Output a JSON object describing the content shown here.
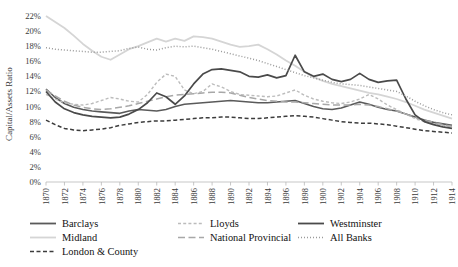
{
  "chart_data": {
    "type": "line",
    "title": "",
    "xlabel": "",
    "ylabel": "Capital/Assets Ratio",
    "ylim": [
      0,
      22
    ],
    "ytick_labels": [
      "0%",
      "2%",
      "4%",
      "6%",
      "8%",
      "10%",
      "12%",
      "14%",
      "16%",
      "18%",
      "20%",
      "22%"
    ],
    "ytick_values": [
      0,
      2,
      4,
      6,
      8,
      10,
      12,
      14,
      16,
      18,
      20,
      22
    ],
    "xlim": [
      1870,
      1914
    ],
    "xtick_labels": [
      "1870",
      "1872",
      "1874",
      "1876",
      "1878",
      "1880",
      "1882",
      "1884",
      "1886",
      "1888",
      "1890",
      "1892",
      "1894",
      "1896",
      "1898",
      "1900",
      "1902",
      "1904",
      "1906",
      "1908",
      "1910",
      "1912",
      "1914"
    ],
    "xtick_values": [
      1870,
      1872,
      1874,
      1876,
      1878,
      1880,
      1882,
      1884,
      1886,
      1888,
      1890,
      1892,
      1894,
      1896,
      1898,
      1900,
      1902,
      1904,
      1906,
      1908,
      1910,
      1912,
      1914
    ],
    "grid": false,
    "legend_position": "bottom",
    "x": [
      1870,
      1871,
      1872,
      1873,
      1874,
      1875,
      1876,
      1877,
      1878,
      1879,
      1880,
      1881,
      1882,
      1883,
      1884,
      1885,
      1886,
      1887,
      1888,
      1889,
      1890,
      1891,
      1892,
      1893,
      1894,
      1895,
      1896,
      1897,
      1898,
      1899,
      1900,
      1901,
      1902,
      1903,
      1904,
      1905,
      1906,
      1907,
      1908,
      1909,
      1910,
      1911,
      1912,
      1913,
      1914
    ],
    "series": [
      {
        "name": "Barclays",
        "color": "#5a5a5a",
        "style": "solid",
        "width": 1.6,
        "values": [
          12.3,
          11.2,
          10.4,
          9.9,
          9.6,
          9.4,
          9.3,
          9.2,
          9.1,
          9.4,
          9.6,
          9.5,
          9.4,
          9.6,
          10.0,
          10.3,
          10.4,
          10.5,
          10.6,
          10.7,
          10.8,
          10.7,
          10.6,
          10.5,
          10.5,
          10.6,
          10.7,
          10.8,
          10.4,
          10.0,
          9.7,
          9.6,
          9.8,
          10.2,
          10.6,
          10.3,
          9.9,
          9.6,
          9.4,
          9.0,
          8.6,
          8.2,
          7.9,
          7.7,
          7.5
        ]
      },
      {
        "name": "Midland",
        "color": "#d5d5d5",
        "style": "solid",
        "width": 1.8,
        "values": [
          22.0,
          21.2,
          20.4,
          19.4,
          18.3,
          17.4,
          16.6,
          16.2,
          16.9,
          17.6,
          18.0,
          18.5,
          19.0,
          18.6,
          19.0,
          18.7,
          19.3,
          19.2,
          19.0,
          18.6,
          18.2,
          17.9,
          18.0,
          18.2,
          17.6,
          16.9,
          16.1,
          15.4,
          14.6,
          13.9,
          13.4,
          13.0,
          12.7,
          12.4,
          12.1,
          11.8,
          11.6,
          11.3,
          11.0,
          10.6,
          10.1,
          9.6,
          9.2,
          8.8,
          8.4
        ]
      },
      {
        "name": "London & County",
        "color": "#3c3c3c",
        "style": "dash-med",
        "width": 1.5,
        "values": [
          8.2,
          7.6,
          7.1,
          6.9,
          6.8,
          6.9,
          7.0,
          7.2,
          7.5,
          7.7,
          7.9,
          8.0,
          8.1,
          8.1,
          8.2,
          8.3,
          8.4,
          8.5,
          8.5,
          8.6,
          8.6,
          8.5,
          8.4,
          8.4,
          8.5,
          8.6,
          8.7,
          8.8,
          8.7,
          8.6,
          8.4,
          8.2,
          8.0,
          7.9,
          7.8,
          7.8,
          7.7,
          7.6,
          7.4,
          7.2,
          7.0,
          6.8,
          6.7,
          6.6,
          6.5
        ]
      },
      {
        "name": "Lloyds",
        "color": "#bcbcbc",
        "style": "dash-short",
        "width": 1.4,
        "values": [
          11.6,
          11.0,
          10.5,
          10.3,
          10.2,
          10.4,
          10.8,
          11.2,
          11.0,
          10.7,
          10.6,
          11.6,
          13.2,
          14.3,
          14.0,
          12.2,
          11.7,
          12.0,
          13.0,
          12.6,
          12.0,
          11.6,
          11.5,
          11.4,
          11.3,
          11.4,
          11.8,
          12.2,
          11.5,
          11.0,
          10.7,
          10.5,
          10.4,
          10.6,
          11.0,
          11.6,
          11.0,
          10.2,
          9.6,
          9.0,
          8.4,
          8.0,
          7.7,
          7.5,
          7.3
        ]
      },
      {
        "name": "National Provincial",
        "color": "#a8a8a8",
        "style": "dash-long",
        "width": 1.5,
        "values": [
          12.2,
          11.4,
          10.7,
          10.2,
          9.9,
          9.7,
          9.6,
          9.7,
          9.9,
          10.1,
          10.4,
          10.7,
          11.0,
          11.3,
          11.5,
          11.6,
          11.7,
          11.8,
          11.9,
          11.9,
          11.8,
          11.5,
          11.2,
          11.0,
          10.8,
          10.7,
          10.6,
          10.6,
          10.5,
          10.4,
          10.3,
          10.2,
          10.2,
          10.2,
          10.3,
          10.2,
          10.0,
          9.7,
          9.4,
          9.0,
          8.6,
          8.2,
          7.9,
          7.6,
          7.4
        ]
      },
      {
        "name": "Westminster",
        "color": "#4a4a4a",
        "style": "solid",
        "width": 1.7,
        "values": [
          12.0,
          10.6,
          9.7,
          9.2,
          8.9,
          8.7,
          8.6,
          8.5,
          8.6,
          9.0,
          9.6,
          10.5,
          11.8,
          11.3,
          10.3,
          11.4,
          13.0,
          14.3,
          14.9,
          15.0,
          14.8,
          14.6,
          14.0,
          13.9,
          14.2,
          13.8,
          14.1,
          16.8,
          14.6,
          14.0,
          14.3,
          13.6,
          13.3,
          13.6,
          14.4,
          13.6,
          13.2,
          13.4,
          13.5,
          11.0,
          8.9,
          8.0,
          7.6,
          7.3,
          7.1
        ]
      },
      {
        "name": "All Banks",
        "color": "#9a9a9a",
        "style": "dotted",
        "width": 1.5,
        "values": [
          17.8,
          17.6,
          17.5,
          17.4,
          17.3,
          17.2,
          17.2,
          17.3,
          17.4,
          17.7,
          17.9,
          17.6,
          17.5,
          17.8,
          18.0,
          17.9,
          18.0,
          17.8,
          17.6,
          17.3,
          17.0,
          16.7,
          16.4,
          16.1,
          15.7,
          15.3,
          14.9,
          14.5,
          14.1,
          13.8,
          13.5,
          13.2,
          13.0,
          12.9,
          12.8,
          12.6,
          12.4,
          12.2,
          12.0,
          11.4,
          10.7,
          10.1,
          9.6,
          9.2,
          8.9
        ]
      }
    ]
  },
  "legend": {
    "entries": [
      {
        "label": "Barclays",
        "color": "#5a5a5a",
        "style": "solid",
        "col": 0,
        "row": 0
      },
      {
        "label": "Midland",
        "color": "#d5d5d5",
        "style": "solid",
        "col": 0,
        "row": 1
      },
      {
        "label": "London & County",
        "color": "#3c3c3c",
        "style": "dash-med",
        "col": 0,
        "row": 2
      },
      {
        "label": "Lloyds",
        "color": "#bcbcbc",
        "style": "dash-short",
        "col": 1,
        "row": 0
      },
      {
        "label": "National Provincial",
        "color": "#a8a8a8",
        "style": "dash-long",
        "col": 1,
        "row": 1
      },
      {
        "label": "Westminster",
        "color": "#4a4a4a",
        "style": "solid",
        "col": 2,
        "row": 0
      },
      {
        "label": "All Banks",
        "color": "#9a9a9a",
        "style": "dotted",
        "col": 2,
        "row": 1
      }
    ]
  }
}
